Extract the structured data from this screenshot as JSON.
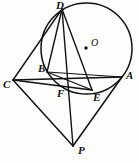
{
  "figure": {
    "background_color": "#fdfdfb",
    "stroke_color": "#111111",
    "circle": {
      "name": "circle-O",
      "cx": 86.5,
      "cy": 48.5,
      "r": 45.5,
      "stroke_width": 1.4
    },
    "center_point": {
      "name": "center-O",
      "cx": 86,
      "cy": 48,
      "r": 1.6,
      "label": "O",
      "label_x": 92,
      "label_y": 39
    },
    "points": [
      {
        "id": "D",
        "label": "D",
        "x": 62,
        "y": 9,
        "label_x": 56,
        "label_y": 0,
        "on_circle": true
      },
      {
        "id": "A",
        "label": "A",
        "x": 122,
        "y": 77,
        "label_x": 126,
        "label_y": 70,
        "on_circle": true
      },
      {
        "id": "B",
        "label": "B",
        "x": 47,
        "y": 72,
        "label_x": 38,
        "label_y": 64,
        "on_circle": true
      },
      {
        "id": "E",
        "label": "E",
        "x": 92,
        "y": 90,
        "label_x": 93,
        "label_y": 91,
        "on_circle": true
      },
      {
        "id": "C",
        "label": "C",
        "x": 13,
        "y": 80,
        "label_x": 4,
        "label_y": 79,
        "on_circle": false
      },
      {
        "id": "F",
        "label": "F",
        "x": 73,
        "y": 87,
        "label_x": 57,
        "label_y": 88,
        "on_circle": false
      },
      {
        "id": "P",
        "label": "P",
        "x": 73,
        "y": 146,
        "label_x": 78,
        "label_y": 144,
        "on_circle": false
      }
    ],
    "segments": [
      {
        "name": "segment-D-C",
        "from": "D",
        "to": "C"
      },
      {
        "name": "segment-D-B",
        "from": "D",
        "to": "B"
      },
      {
        "name": "segment-D-F",
        "from": "D",
        "to": "F"
      },
      {
        "name": "segment-D-P",
        "from": "D",
        "to": "P"
      },
      {
        "name": "segment-D-E",
        "from": "D",
        "to": "E"
      },
      {
        "name": "segment-C-A",
        "from": "C",
        "to": "A"
      },
      {
        "name": "segment-C-E",
        "from": "C",
        "to": "E"
      },
      {
        "name": "segment-C-P",
        "from": "C",
        "to": "P"
      },
      {
        "name": "segment-A-P",
        "from": "A",
        "to": "P"
      },
      {
        "name": "segment-B-E",
        "from": "B",
        "to": "E"
      },
      {
        "name": "segment-B-A",
        "from": "B",
        "to": "A"
      }
    ]
  }
}
